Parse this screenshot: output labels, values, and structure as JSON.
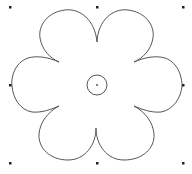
{
  "shape": {
    "type": "flower",
    "petal_count": 6,
    "stroke_color": "#555555",
    "fill_color": "#ffffff",
    "center": {
      "x": 97,
      "y": 85,
      "ring_radius": 10
    }
  },
  "selection": {
    "handle_color": "#222222",
    "handles": [
      {
        "id": "top-left",
        "x": 10,
        "y": 7
      },
      {
        "id": "top-center",
        "x": 97,
        "y": 7
      },
      {
        "id": "top-right",
        "x": 183,
        "y": 7
      },
      {
        "id": "middle-left",
        "x": 10,
        "y": 85
      },
      {
        "id": "middle-right",
        "x": 183,
        "y": 85
      },
      {
        "id": "bottom-left",
        "x": 10,
        "y": 163
      },
      {
        "id": "bottom-center",
        "x": 97,
        "y": 163
      },
      {
        "id": "bottom-right",
        "x": 183,
        "y": 163
      }
    ]
  }
}
